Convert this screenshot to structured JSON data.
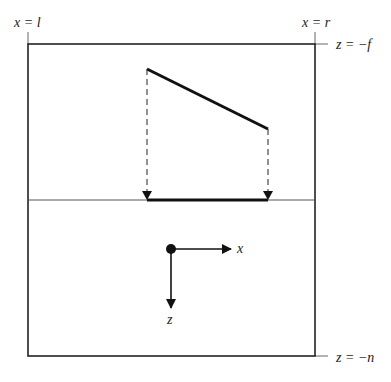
{
  "diagram": {
    "labels": {
      "left_plane": "x = l",
      "right_plane": "x = r",
      "far_plane": "z = −f",
      "near_plane": "z = −n",
      "axis_x": "x",
      "axis_z": "z"
    },
    "frustum_box": {
      "x1": 28,
      "y1": 44,
      "x2": 315,
      "y2": 356
    },
    "projection_plane_y": 200,
    "segment": {
      "x1": 147,
      "y1": 69,
      "x2": 268,
      "y2": 129
    },
    "projected_segment": {
      "x1": 147,
      "x2": 268,
      "y": 200
    },
    "axes_origin": {
      "x": 171,
      "y": 249
    },
    "colors": {
      "stroke": "#111111",
      "thin": "#444444",
      "background": "#ffffff"
    }
  }
}
